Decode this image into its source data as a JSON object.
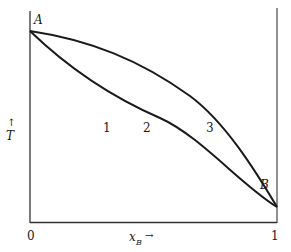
{
  "diagram": {
    "type": "phase-diagram",
    "points": {
      "A": "A",
      "B": "B"
    },
    "regions": [
      "1",
      "2",
      "3"
    ],
    "axes": {
      "y_arrow": "↑",
      "y_label": "T",
      "x_label_main": "x",
      "x_label_sub": "B",
      "x_arrow": "→",
      "x_tick_min": "0",
      "x_tick_max": "1"
    },
    "colors": {
      "line": "#1a1a1a",
      "axis": "#333333",
      "background": "#ffffff"
    }
  }
}
